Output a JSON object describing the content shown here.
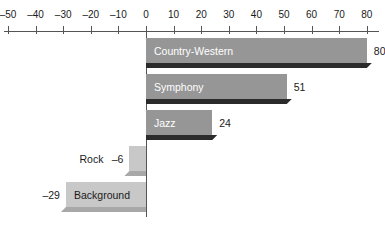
{
  "chart_data": {
    "type": "bar",
    "orientation": "horizontal",
    "title": "",
    "subtitle": "",
    "xlabel": "",
    "ylabel": "",
    "grid": false,
    "legend": null,
    "xlim": [
      -50,
      80
    ],
    "xticks": [
      -50,
      -40,
      -30,
      -20,
      -10,
      0,
      10,
      20,
      30,
      40,
      50,
      60,
      70,
      80
    ],
    "xticklabels": [
      "–50",
      "–40",
      "–30",
      "–20",
      "–10",
      "0",
      "10",
      "20",
      "30",
      "40",
      "50",
      "60",
      "70",
      "80"
    ],
    "categories": [
      "Country-Western",
      "Symphony",
      "Jazz",
      "Rock",
      "Background"
    ],
    "values": [
      80,
      51,
      24,
      -6,
      -29
    ],
    "value_labels": [
      "80",
      "51",
      "24",
      "–6",
      "–29"
    ],
    "series": [
      {
        "name": "value",
        "values": [
          80,
          51,
          24,
          -6,
          -29
        ]
      }
    ],
    "bars": [
      {
        "category": "Country-Western",
        "value": 80,
        "value_label": "80",
        "sign": "positive",
        "label_placement": "inside",
        "value_placement": "outside-right"
      },
      {
        "category": "Symphony",
        "value": 51,
        "value_label": "51",
        "sign": "positive",
        "label_placement": "inside",
        "value_placement": "outside-right"
      },
      {
        "category": "Jazz",
        "value": 24,
        "value_label": "24",
        "sign": "positive",
        "label_placement": "inside",
        "value_placement": "outside-right"
      },
      {
        "category": "Rock",
        "value": -6,
        "value_label": "–6",
        "sign": "negative",
        "label_placement": "outside-left",
        "value_placement": "outside-left"
      },
      {
        "category": "Background",
        "value": -29,
        "value_label": "–29",
        "sign": "negative",
        "label_placement": "inside",
        "value_placement": "outside-left"
      }
    ],
    "colors": {
      "positive_bar": "#969696",
      "negative_bar": "#c8c8c8",
      "positive_shadow": "#2b2b2b",
      "negative_shadow": "#a8a8a8",
      "axis": "#555555",
      "background": "#ffffff",
      "positive_label_text": "#ffffff",
      "negative_label_text": "#1a1a1a",
      "tick_text": "#1a1a1a"
    }
  }
}
